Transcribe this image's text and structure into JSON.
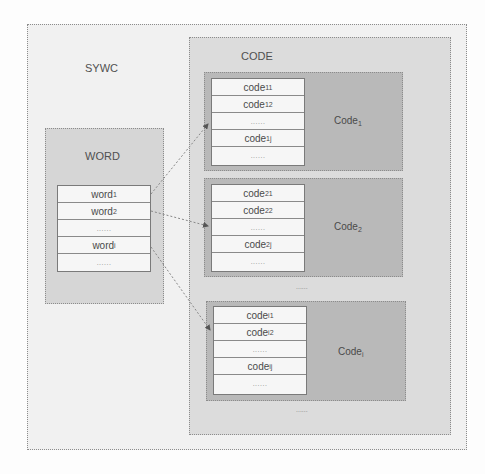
{
  "diagram": {
    "outer": {
      "label": "SYWC"
    },
    "word_region": {
      "label": "WORD",
      "rows": [
        {
          "base": "word",
          "sub": "1"
        },
        {
          "base": "word",
          "sub": "2"
        },
        {
          "base": "......",
          "sub": ""
        },
        {
          "base": "word",
          "sub": "i"
        },
        {
          "base": "......",
          "sub": ""
        }
      ]
    },
    "code_region": {
      "label": "CODE",
      "groups": [
        {
          "label": "Code",
          "label_sub": "1",
          "rows": [
            {
              "base": "code",
              "sub": "11"
            },
            {
              "base": "code",
              "sub": "12"
            },
            {
              "base": "......",
              "sub": ""
            },
            {
              "base": "code",
              "sub": "1j"
            },
            {
              "base": "......",
              "sub": ""
            }
          ]
        },
        {
          "label": "Code",
          "label_sub": "2",
          "rows": [
            {
              "base": "code",
              "sub": "21"
            },
            {
              "base": "code",
              "sub": "22"
            },
            {
              "base": "......",
              "sub": ""
            },
            {
              "base": "code",
              "sub": "2j"
            },
            {
              "base": "......",
              "sub": ""
            }
          ]
        },
        {
          "label": "Code",
          "label_sub": "i",
          "rows": [
            {
              "base": "code",
              "sub": "i1"
            },
            {
              "base": "code",
              "sub": "i2"
            },
            {
              "base": "......",
              "sub": ""
            },
            {
              "base": "code",
              "sub": "ij"
            },
            {
              "base": "......",
              "sub": ""
            }
          ]
        }
      ],
      "between_ellipsis": "......",
      "bottom_ellipsis": "......"
    },
    "arrows": [
      {
        "from": "word1",
        "to": "Code1"
      },
      {
        "from": "word2",
        "to": "Code2"
      },
      {
        "from": "wordi",
        "to": "Codei"
      }
    ],
    "colors": {
      "outer_bg": "#f1f1f1",
      "code_region_bg": "#dcdcdc",
      "word_region_bg": "#d6d6d6",
      "group_bg": "#b9b9b9",
      "table_bg": "#f6f6f6",
      "border": "#8c8c8c"
    }
  }
}
